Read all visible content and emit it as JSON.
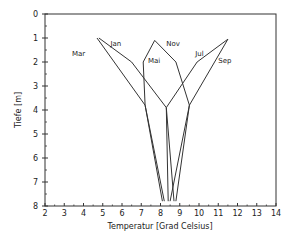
{
  "chart_data": {
    "type": "line",
    "title": "",
    "xlabel": "Temperatur [Grad Celsius]",
    "ylabel": "Tiefe [m]",
    "xlim": [
      2,
      14
    ],
    "ylim": [
      8,
      0
    ],
    "x_ticks": [
      2,
      3,
      4,
      5,
      6,
      7,
      8,
      9,
      10,
      11,
      12,
      13,
      14
    ],
    "y_ticks": [
      0,
      1,
      2,
      3,
      4,
      5,
      6,
      7,
      8
    ],
    "grid": false,
    "legend": "inline labels",
    "series": [
      {
        "name": "Mar",
        "points": [
          [
            4.7,
            1.0
          ],
          [
            7.2,
            3.8
          ],
          [
            8.1,
            7.8
          ]
        ],
        "label_pos": [
          3.4,
          1.75
        ]
      },
      {
        "name": "Jan",
        "points": [
          [
            4.8,
            1.0
          ],
          [
            6.5,
            2.0
          ],
          [
            8.3,
            3.9
          ],
          [
            8.7,
            7.8
          ]
        ],
        "label_pos": [
          5.4,
          1.35
        ]
      },
      {
        "name": "Mai",
        "points": [
          [
            7.7,
            1.1
          ],
          [
            7.1,
            2.0
          ],
          [
            7.2,
            3.8
          ],
          [
            8.2,
            7.8
          ]
        ],
        "label_pos": [
          7.35,
          2.05
        ]
      },
      {
        "name": "Nov",
        "points": [
          [
            7.7,
            1.1
          ],
          [
            8.8,
            2.0
          ],
          [
            9.5,
            3.8
          ],
          [
            8.5,
            7.8
          ]
        ],
        "label_pos": [
          8.3,
          1.35
        ]
      },
      {
        "name": "Jul",
        "points": [
          [
            11.5,
            1.05
          ],
          [
            9.9,
            2.0
          ],
          [
            8.3,
            3.9
          ],
          [
            8.4,
            7.8
          ]
        ],
        "label_pos": [
          9.8,
          1.75
        ]
      },
      {
        "name": "Sep",
        "points": [
          [
            11.5,
            1.05
          ],
          [
            9.5,
            3.8
          ],
          [
            8.8,
            7.8
          ]
        ],
        "label_pos": [
          11.0,
          2.05
        ]
      }
    ]
  }
}
